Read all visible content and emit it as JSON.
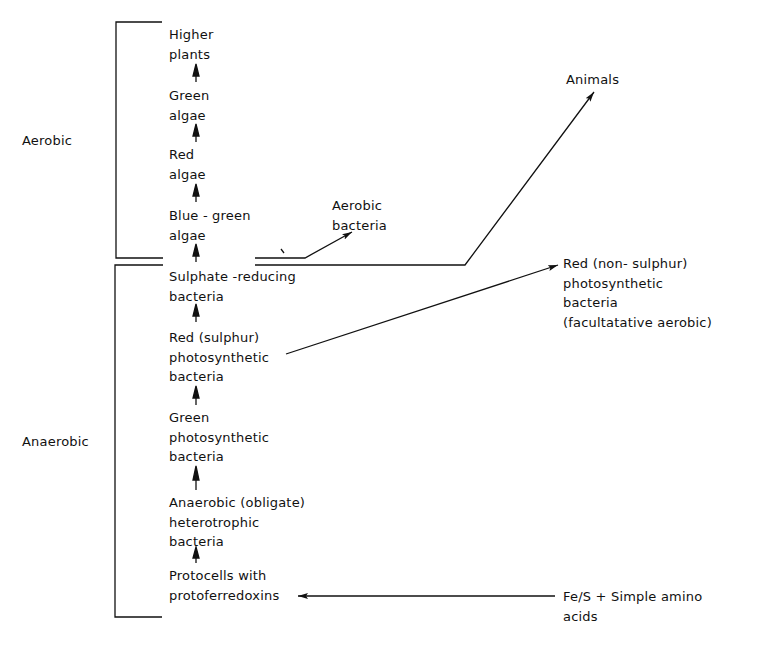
{
  "zones": {
    "aerobic": "Aerobic",
    "anaerobic": "Anaerobic"
  },
  "chain": [
    {
      "id": "higher-plants",
      "lines": [
        "Higher",
        "plants"
      ]
    },
    {
      "id": "green-algae",
      "lines": [
        "Green",
        "algae"
      ]
    },
    {
      "id": "red-algae",
      "lines": [
        "Red",
        "algae"
      ]
    },
    {
      "id": "blue-green-algae",
      "lines": [
        "Blue - green",
        "algae"
      ]
    },
    {
      "id": "sulphate-reducing-bacteria",
      "lines": [
        "Sulphate -reducing",
        "bacteria"
      ]
    },
    {
      "id": "red-sulphur-photosynthetic-bacteria",
      "lines": [
        "Red (sulphur)",
        "photosynthetic",
        "bacteria"
      ]
    },
    {
      "id": "green-photosynthetic-bacteria",
      "lines": [
        "Green",
        "photosynthetic",
        "bacteria"
      ]
    },
    {
      "id": "anaerobic-heterotrophic-bacteria",
      "lines": [
        "Anaerobic (obligate)",
        "heterotrophic",
        "bacteria"
      ]
    },
    {
      "id": "protocells",
      "lines": [
        "Protocells with",
        "protoferredoxins"
      ]
    }
  ],
  "branches": {
    "aerobic_bacteria": {
      "lines": [
        "Aerobic",
        "bacteria"
      ]
    },
    "animals": {
      "lines": [
        "Animals"
      ]
    },
    "red_non_sulphur": {
      "lines": [
        "Red (non- sulphur)",
        "photosynthetic",
        "bacteria",
        "(facultatative aerobic)"
      ]
    },
    "source": {
      "lines": [
        "Fe/S + Simple amino",
        "acids"
      ]
    }
  }
}
